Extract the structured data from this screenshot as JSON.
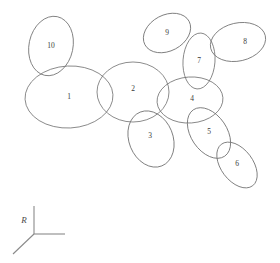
{
  "figure": {
    "background_color": "#ffffff",
    "stroke_color": "#6f6f6f",
    "label_color": "#3a3a3a",
    "axis_color": "#8a8a8a",
    "width": 280,
    "height": 263
  },
  "chart_data": {
    "type": "scatter",
    "title": "",
    "xlabel": "",
    "ylabel": "",
    "grid": false,
    "legend": null,
    "annotations": [
      "R"
    ],
    "categories": [
      "1",
      "2",
      "3",
      "4",
      "5",
      "6",
      "7",
      "8",
      "9",
      "10"
    ],
    "values": [
      1,
      2,
      3,
      4,
      5,
      6,
      7,
      8,
      9,
      10
    ]
  },
  "ellipses": [
    {
      "label": "1",
      "cx": 69,
      "cy": 97,
      "rx": 44,
      "ry": 31,
      "rot": -3,
      "label_x": 69,
      "label_y": 97
    },
    {
      "label": "2",
      "cx": 133,
      "cy": 92,
      "rx": 36,
      "ry": 30,
      "rot": 0,
      "label_x": 133,
      "label_y": 89
    },
    {
      "label": "3",
      "cx": 151,
      "cy": 139,
      "rx": 22,
      "ry": 29,
      "rot": -22,
      "label_x": 150,
      "label_y": 136
    },
    {
      "label": "4",
      "cx": 190,
      "cy": 100,
      "rx": 33,
      "ry": 23,
      "rot": -4,
      "label_x": 192,
      "label_y": 99
    },
    {
      "label": "5",
      "cx": 209,
      "cy": 133,
      "rx": 18,
      "ry": 28,
      "rot": -34,
      "label_x": 209,
      "label_y": 132
    },
    {
      "label": "6",
      "cx": 237,
      "cy": 165,
      "rx": 16,
      "ry": 26,
      "rot": -37,
      "label_x": 237,
      "label_y": 164
    },
    {
      "label": "7",
      "cx": 199,
      "cy": 61,
      "rx": 16,
      "ry": 28,
      "rot": 4,
      "label_x": 199,
      "label_y": 61
    },
    {
      "label": "8",
      "cx": 238,
      "cy": 42,
      "rx": 28,
      "ry": 19,
      "rot": -13,
      "label_x": 245,
      "label_y": 42
    },
    {
      "label": "9",
      "cx": 167,
      "cy": 33,
      "rx": 25,
      "ry": 18,
      "rot": -28,
      "label_x": 167,
      "label_y": 33
    },
    {
      "label": "10",
      "cx": 51,
      "cy": 46,
      "rx": 22,
      "ry": 30,
      "rot": 12,
      "label_x": 51,
      "label_y": 46
    }
  ],
  "axis_indicator": {
    "label": "R",
    "label_x": 24,
    "label_y": 221,
    "origin": {
      "x": 34,
      "y": 234
    },
    "arms": [
      {
        "name": "vertical-axis-arm",
        "x2": 34,
        "y2": 206
      },
      {
        "name": "horizontal-axis-arm",
        "x2": 65,
        "y2": 234
      },
      {
        "name": "diagonal-axis-arm",
        "x2": 13,
        "y2": 254
      }
    ]
  }
}
